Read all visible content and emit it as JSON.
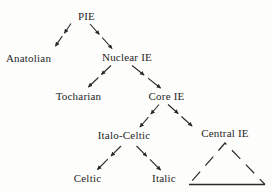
{
  "diagram": {
    "type": "tree",
    "background_color": "#fdfdfc",
    "ink_color": "#2a2a2a",
    "text_color": "#1f1f1f",
    "nodes": [
      {
        "id": "pie",
        "label": "PIE",
        "x": 86.5,
        "y": 20
      },
      {
        "id": "anatolian",
        "label": "Anatolian",
        "x": 28.5,
        "y": 62
      },
      {
        "id": "nuclear-ie",
        "label": "Nuclear IE",
        "x": 127,
        "y": 61
      },
      {
        "id": "tocharian",
        "label": "Tocharian",
        "x": 78.5,
        "y": 100
      },
      {
        "id": "core-ie",
        "label": "Core IE",
        "x": 166.5,
        "y": 100
      },
      {
        "id": "italo-celtic",
        "label": "Italo-Celtic",
        "x": 124,
        "y": 139
      },
      {
        "id": "central-ie",
        "label": "Central IE",
        "x": 225,
        "y": 137
      },
      {
        "id": "celtic",
        "label": "Celtic",
        "x": 87.5,
        "y": 182
      },
      {
        "id": "italic",
        "label": "Italic",
        "x": 164,
        "y": 182
      }
    ],
    "edges": [
      {
        "from": "pie",
        "to": "anatolian",
        "x1": 71,
        "y1": 23.5,
        "x2": 55.5,
        "y2": 46
      },
      {
        "from": "pie",
        "to": "nuclear-ie",
        "x1": 90,
        "y1": 24,
        "x2": 112,
        "y2": 48.5
      },
      {
        "from": "nuclear-ie",
        "to": "tocharian",
        "x1": 111,
        "y1": 65.5,
        "x2": 88.5,
        "y2": 87
      },
      {
        "from": "nuclear-ie",
        "to": "core-ie",
        "x1": 132,
        "y1": 65.5,
        "x2": 160.5,
        "y2": 88
      },
      {
        "from": "core-ie",
        "to": "italo-celtic",
        "x1": 159,
        "y1": 104.5,
        "x2": 140,
        "y2": 127
      },
      {
        "from": "core-ie",
        "to": "central-ie",
        "x1": 168,
        "y1": 104.5,
        "x2": 192,
        "y2": 126
      },
      {
        "from": "italo-celtic",
        "to": "celtic",
        "x1": 121,
        "y1": 146,
        "x2": 97.5,
        "y2": 169.5
      },
      {
        "from": "italo-celtic",
        "to": "italic",
        "x1": 136.5,
        "y1": 146,
        "x2": 160.5,
        "y2": 170
      }
    ],
    "edge_style": {
      "kind": "dashed-arrow",
      "segments_per_edge": 2,
      "stroke_width": 1.1
    },
    "triangle": {
      "meaning": "further (unlisted) descendants of Central IE",
      "apex_x": 225,
      "apex_y": 143,
      "base_left_x": 189,
      "base_right_x": 265,
      "base_y": 184.5,
      "sides": "dashed",
      "base": "solid"
    }
  }
}
